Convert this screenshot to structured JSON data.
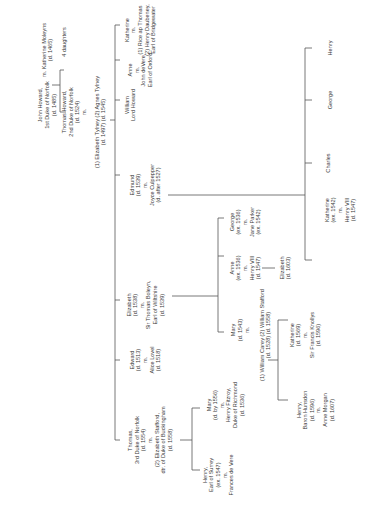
{
  "diagram": {
    "orientation": "rotated -90deg (text reads bottom-to-top)",
    "line_color": "#555555",
    "text_color": "#3a3a3a",
    "people": [
      {
        "id": "john",
        "x": 47,
        "y": 105,
        "lines": [
          "John Howard,",
          "1st Duke of Norfolk",
          "(d. 1485)"
        ]
      },
      {
        "id": "katherine_moleyns",
        "x": 47,
        "y": 50,
        "lines": [
          "m.  Katherine Moleyns",
          "(d. 1465)"
        ]
      },
      {
        "id": "four_daughters",
        "x": 64,
        "y": 42,
        "lines": [
          "4 daughters"
        ]
      },
      {
        "id": "thomas_2nd",
        "x": 74,
        "y": 112,
        "lines": [
          "Thomas Howard,",
          "2nd Duke of Norfolk",
          "(d. 1524)",
          "m."
        ]
      },
      {
        "id": "tylney_wives",
        "x": 100,
        "y": 122,
        "lines": [
          "(1) Elizabeth Tylney (2) Agnes Tylney",
          "(d. 1497)                    (d. 1545)"
        ]
      },
      {
        "id": "william",
        "x": 130,
        "y": 105,
        "lines": [
          "William",
          "Lord Howard"
        ]
      },
      {
        "id": "anne_veer",
        "x": 140,
        "y": 70,
        "lines": [
          "Anne",
          "m.",
          "John deVere,",
          "Earl of Oxford"
        ]
      },
      {
        "id": "katherine_d",
        "x": 140,
        "y": 30,
        "lines": [
          "Katherine",
          "m.",
          "(1) Rice ap Thomas",
          "(2) Henry Daubeney,",
          "Earl of Bridgewater"
        ]
      },
      {
        "id": "edmund",
        "x": 145,
        "y": 185,
        "lines": [
          "Edmund",
          "(d. 1539)",
          "m.",
          "Joyce Culpepper",
          "(d. after 1527)"
        ]
      },
      {
        "id": "elizabeth_boleyn",
        "x": 145,
        "y": 305,
        "lines": [
          "Elizabeth",
          "(d. 1538)",
          "m.",
          "Sir Thomas Boleyn,",
          "Earl of Wiltshire",
          "(d. 1539)"
        ]
      },
      {
        "id": "edward",
        "x": 145,
        "y": 360,
        "lines": [
          "Edward",
          "(d. 1513)",
          "m.",
          "Alice Lovel",
          "(d. 1518)"
        ]
      },
      {
        "id": "thomas_3rd",
        "x": 150,
        "y": 440,
        "lines": [
          "Thomas,",
          "3rd Duke of Norfolk",
          "(d. 1554)",
          "m.",
          "(2) Elizabeth Stafford,",
          "dtr. of Duke of Buckingham",
          "(d. 1558)"
        ]
      },
      {
        "id": "george_boleyn",
        "x": 245,
        "y": 222,
        "lines": [
          "George",
          "(ex. 1536)",
          "m.",
          "Jane Parker",
          "(ex. 1542)"
        ]
      },
      {
        "id": "anne_boleyn",
        "x": 245,
        "y": 268,
        "lines": [
          "Anne",
          "(ex. 1536)",
          "m.",
          "Henry VIII",
          "(d. 1547)"
        ]
      },
      {
        "id": "elizabeth_i",
        "x": 285,
        "y": 268,
        "lines": [
          "Elizabeth",
          "(d. 1603)"
        ]
      },
      {
        "id": "mary_boleyn",
        "x": 240,
        "y": 330,
        "lines": [
          "Mary",
          "(d. 1543)",
          "m."
        ]
      },
      {
        "id": "carey_stafford",
        "x": 265,
        "y": 335,
        "lines": [
          "(1) William Carey (2) William Stafford",
          "(d. 1528)                    (d. 1558)"
        ]
      },
      {
        "id": "katherine_knollys",
        "x": 305,
        "y": 335,
        "lines": [
          "Katherine",
          "(d. 1569)",
          "m.",
          "Sir Francis Knollys",
          "(d. 1596)"
        ]
      },
      {
        "id": "henry_hunsdon",
        "x": 315,
        "y": 410,
        "lines": [
          "Henry,",
          "Baron Hunsdon",
          "(d. 1596)",
          "m.",
          "Anne Morgan",
          "(d. 1607)"
        ]
      },
      {
        "id": "mary_fitzroy",
        "x": 225,
        "y": 405,
        "lines": [
          "Mary",
          "(d. by 1556)",
          "m.",
          "Henry Fitzroy,",
          "Duke of Richmond",
          "(d. 1536)"
        ]
      },
      {
        "id": "henry_surrey",
        "x": 218,
        "y": 475,
        "lines": [
          "Henry,",
          "Earl of Surrey",
          "(ex. 1547)",
          "m.",
          "Frances de Vere"
        ]
      },
      {
        "id": "henry_son",
        "x": 330,
        "y": 48,
        "lines": [
          "Henry"
        ]
      },
      {
        "id": "george_son",
        "x": 330,
        "y": 100,
        "lines": [
          "George"
        ]
      },
      {
        "id": "charles_son",
        "x": 328,
        "y": 163,
        "lines": [
          "Charles"
        ]
      },
      {
        "id": "katherine_howard",
        "x": 340,
        "y": 210,
        "lines": [
          "Katherine",
          "(ex. 1542)",
          "m.",
          "Henry VIII",
          "(d. 1547)"
        ]
      }
    ],
    "connectors": [
      {
        "x1": 60,
        "y1": 70,
        "x2": 60,
        "y2": 112
      },
      {
        "x1": 60,
        "y1": 70,
        "x2": 64,
        "y2": 70
      },
      {
        "x1": 60,
        "y1": 112,
        "x2": 66,
        "y2": 112
      },
      {
        "x1": 52,
        "y1": 85,
        "x2": 60,
        "y2": 85
      },
      {
        "x1": 115,
        "y1": 25,
        "x2": 115,
        "y2": 440
      },
      {
        "x1": 110,
        "y1": 120,
        "x2": 115,
        "y2": 120
      },
      {
        "x1": 115,
        "y1": 25,
        "x2": 120,
        "y2": 25
      },
      {
        "x1": 115,
        "y1": 60,
        "x2": 120,
        "y2": 60
      },
      {
        "x1": 115,
        "y1": 100,
        "x2": 120,
        "y2": 100
      },
      {
        "x1": 115,
        "y1": 175,
        "x2": 120,
        "y2": 175
      },
      {
        "x1": 115,
        "y1": 300,
        "x2": 120,
        "y2": 300
      },
      {
        "x1": 115,
        "y1": 360,
        "x2": 120,
        "y2": 360
      },
      {
        "x1": 115,
        "y1": 440,
        "x2": 120,
        "y2": 440
      },
      {
        "x1": 168,
        "y1": 195,
        "x2": 305,
        "y2": 195
      },
      {
        "x1": 305,
        "y1": 48,
        "x2": 305,
        "y2": 260
      },
      {
        "x1": 305,
        "y1": 48,
        "x2": 312,
        "y2": 48
      },
      {
        "x1": 305,
        "y1": 100,
        "x2": 312,
        "y2": 100
      },
      {
        "x1": 305,
        "y1": 163,
        "x2": 312,
        "y2": 163
      },
      {
        "x1": 305,
        "y1": 260,
        "x2": 312,
        "y2": 260
      },
      {
        "x1": 172,
        "y1": 296,
        "x2": 218,
        "y2": 296
      },
      {
        "x1": 218,
        "y1": 218,
        "x2": 218,
        "y2": 332
      },
      {
        "x1": 218,
        "y1": 218,
        "x2": 224,
        "y2": 218
      },
      {
        "x1": 218,
        "y1": 256,
        "x2": 224,
        "y2": 256
      },
      {
        "x1": 218,
        "y1": 332,
        "x2": 224,
        "y2": 332
      },
      {
        "x1": 262,
        "y1": 268,
        "x2": 275,
        "y2": 268
      },
      {
        "x1": 268,
        "y1": 360,
        "x2": 278,
        "y2": 360
      },
      {
        "x1": 278,
        "y1": 320,
        "x2": 278,
        "y2": 400
      },
      {
        "x1": 278,
        "y1": 320,
        "x2": 288,
        "y2": 320
      },
      {
        "x1": 278,
        "y1": 400,
        "x2": 288,
        "y2": 400
      },
      {
        "x1": 180,
        "y1": 440,
        "x2": 192,
        "y2": 440
      },
      {
        "x1": 192,
        "y1": 408,
        "x2": 192,
        "y2": 470
      },
      {
        "x1": 192,
        "y1": 408,
        "x2": 200,
        "y2": 408
      },
      {
        "x1": 192,
        "y1": 470,
        "x2": 200,
        "y2": 470
      }
    ]
  }
}
